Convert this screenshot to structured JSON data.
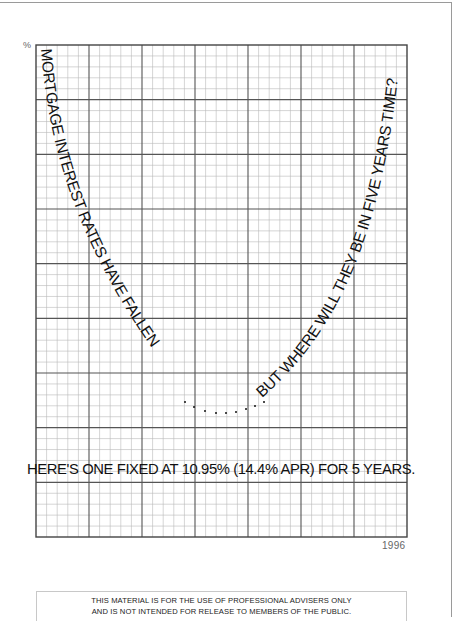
{
  "document": {
    "axis_unit_label": "%",
    "year_label": "1996",
    "curve_left_text": "MORTGAGE INTEREST RATES HAVE FALLEN",
    "curve_right_text": "BUT WHERE WILL THEY BE IN FIVE YEARS TIME?",
    "headline": "HERE'S ONE FIXED AT 10.95% (14.4% APR) FOR 5 YEARS.",
    "footer": {
      "line1": "THIS MATERIAL IS FOR THE USE OF PROFESSIONAL ADVISERS ONLY",
      "line2": "AND IS NOT INTENDED FOR RELEASE TO MEMBERS OF THE PUBLIC."
    }
  },
  "grid": {
    "major_columns": 7,
    "major_rows": 9,
    "minor_per_major": 5,
    "major_line_color": "#555555",
    "minor_line_color": "#b8b8b8"
  },
  "chart_data": {
    "type": "line",
    "xlabel": "",
    "ylabel": "%",
    "x_end_label": "1996",
    "annotation": "HERE'S ONE FIXED AT 10.95% (14.4% APR) FOR 5 YEARS.",
    "grid": true,
    "shape": "U-shaped curve formed by text; falling on left, dotted trough, rising on right",
    "fixed_rate_pct": 10.95,
    "apr_pct": 14.4,
    "term_years": 5
  }
}
